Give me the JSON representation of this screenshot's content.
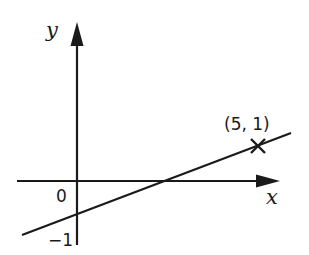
{
  "diagram": {
    "type": "coordinate-graph",
    "axes": {
      "x_label": "x",
      "y_label": "y",
      "origin_label": "0"
    },
    "line": {
      "description": "straight line with positive gradient",
      "y_intercept_label": "−1",
      "y_intercept": -1,
      "marked_point": {
        "label": "(5, 1)",
        "x": 5,
        "y": 1,
        "marker": "cross"
      }
    },
    "colors": {
      "ink": "#1a1a1a",
      "background": "#ffffff"
    }
  }
}
